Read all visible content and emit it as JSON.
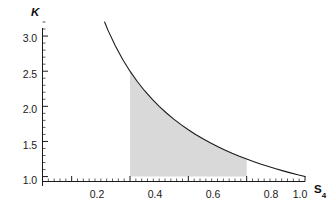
{
  "chart_data": {
    "type": "line",
    "title": "",
    "subtitle": "",
    "xlabel": "S",
    "xlabel_subscript": "4",
    "ylabel": "K",
    "xlim": [
      0.1,
      1.0
    ],
    "ylim": [
      0.93,
      3.2
    ],
    "grid": false,
    "legend": null,
    "legend_position": "none",
    "xticks": [
      "0.2",
      "0.4",
      "0.6",
      "0.8",
      "1.0"
    ],
    "xtick_values": [
      0.2,
      0.4,
      0.6,
      0.8,
      1.0
    ],
    "yticks": [
      "1.0",
      "1.5",
      "2.0",
      "2.5",
      "3.0"
    ],
    "ytick_values": [
      1.0,
      1.5,
      2.0,
      2.5,
      3.0
    ],
    "minor_ticks": true,
    "series": [
      {
        "name": "K = 1/S4",
        "color": "#1a1a1a",
        "linewidth": 1.1,
        "x": [
          0.1,
          0.125,
          0.15,
          0.175,
          0.2,
          0.225,
          0.25,
          0.275,
          0.3,
          0.325,
          0.35,
          0.375,
          0.4,
          0.425,
          0.45,
          0.475,
          0.5,
          0.525,
          0.55,
          0.575,
          0.6,
          0.625,
          0.65,
          0.675,
          0.7,
          0.725,
          0.75,
          0.775,
          0.8,
          0.825,
          0.85,
          0.875,
          0.9,
          0.925,
          0.95,
          0.975,
          1.0
        ],
        "values": [
          10.0,
          8.0,
          6.667,
          5.714,
          5.0,
          4.444,
          4.0,
          3.636,
          3.333,
          3.077,
          2.857,
          2.667,
          2.5,
          2.353,
          2.222,
          2.105,
          2.0,
          1.905,
          1.818,
          1.739,
          1.667,
          1.6,
          1.538,
          1.481,
          1.429,
          1.379,
          1.333,
          1.29,
          1.25,
          1.212,
          1.176,
          1.143,
          1.111,
          1.081,
          1.053,
          1.026,
          1.0
        ]
      }
    ],
    "shaded_region": {
      "label": "shaded area under curve",
      "x_start": 0.4,
      "x_end": 0.8,
      "y_baseline": 1.0,
      "fill_color": "#d9d9d9",
      "y_at_x_start": 2.5,
      "y_at_x_end": 1.25
    },
    "annotations": []
  },
  "axes": {
    "axis_color": "#1a1a1a",
    "background": "#ffffff"
  }
}
